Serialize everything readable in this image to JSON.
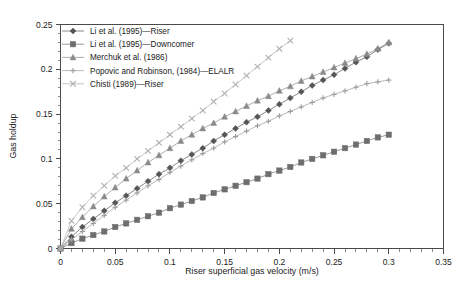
{
  "chart_data": {
    "type": "line",
    "title": "",
    "xlabel": "Riser superficial gas velocity (m/s)",
    "ylabel": "Gas holdup",
    "xlim": [
      0,
      0.35
    ],
    "ylim": [
      0,
      0.25
    ],
    "xticks": [
      "0",
      "0.05",
      "0.1",
      "0.15",
      "0.2",
      "0.25",
      "0.3",
      "0.35"
    ],
    "xtick_values": [
      0,
      0.05,
      0.1,
      0.15,
      0.2,
      0.25,
      0.3,
      0.35
    ],
    "yticks": [
      "0",
      "0.05",
      "0.1",
      "0.15",
      "0.2",
      "0.25"
    ],
    "ytick_values": [
      0,
      0.05,
      0.1,
      0.15,
      0.2,
      0.25
    ],
    "minor_tick_step_x": 0.01,
    "minor_tick_step_y": 0.01,
    "grid": false,
    "legend_position": "top-left",
    "series": [
      {
        "name": "Li et al. (1995)—Riser",
        "marker": "diamond",
        "color": "#555555",
        "x": [
          0,
          0.01,
          0.02,
          0.03,
          0.04,
          0.05,
          0.06,
          0.07,
          0.08,
          0.09,
          0.1,
          0.11,
          0.12,
          0.13,
          0.14,
          0.15,
          0.16,
          0.17,
          0.18,
          0.19,
          0.2,
          0.21,
          0.22,
          0.23,
          0.24,
          0.25,
          0.26,
          0.27,
          0.28,
          0.29,
          0.3
        ],
        "values": [
          0,
          0.013,
          0.024,
          0.033,
          0.042,
          0.051,
          0.059,
          0.067,
          0.075,
          0.083,
          0.09,
          0.098,
          0.105,
          0.112,
          0.12,
          0.127,
          0.134,
          0.141,
          0.147,
          0.154,
          0.161,
          0.168,
          0.175,
          0.182,
          0.188,
          0.194,
          0.201,
          0.208,
          0.214,
          0.222,
          0.229
        ]
      },
      {
        "name": "Li et al. (1995)—Downcomer",
        "marker": "square",
        "color": "#6e6e6e",
        "x": [
          0,
          0.01,
          0.02,
          0.03,
          0.04,
          0.05,
          0.06,
          0.07,
          0.08,
          0.09,
          0.1,
          0.11,
          0.12,
          0.13,
          0.14,
          0.15,
          0.16,
          0.17,
          0.18,
          0.19,
          0.2,
          0.21,
          0.22,
          0.23,
          0.24,
          0.25,
          0.26,
          0.27,
          0.28,
          0.29,
          0.3
        ],
        "values": [
          0,
          0.006,
          0.011,
          0.015,
          0.019,
          0.024,
          0.028,
          0.032,
          0.036,
          0.04,
          0.045,
          0.049,
          0.053,
          0.057,
          0.062,
          0.066,
          0.07,
          0.074,
          0.078,
          0.083,
          0.087,
          0.091,
          0.096,
          0.1,
          0.104,
          0.108,
          0.112,
          0.116,
          0.12,
          0.124,
          0.127
        ]
      },
      {
        "name": "Merchuk et al. (1986)",
        "marker": "triangle",
        "color": "#8a8a8a",
        "x": [
          0,
          0.01,
          0.02,
          0.03,
          0.04,
          0.05,
          0.06,
          0.07,
          0.08,
          0.09,
          0.1,
          0.11,
          0.12,
          0.13,
          0.14,
          0.15,
          0.16,
          0.17,
          0.18,
          0.19,
          0.2,
          0.21,
          0.22,
          0.23,
          0.24,
          0.25,
          0.26,
          0.27,
          0.28,
          0.29,
          0.3
        ],
        "values": [
          0,
          0.022,
          0.035,
          0.047,
          0.058,
          0.068,
          0.078,
          0.087,
          0.096,
          0.104,
          0.112,
          0.12,
          0.127,
          0.134,
          0.14,
          0.147,
          0.153,
          0.159,
          0.165,
          0.17,
          0.176,
          0.181,
          0.187,
          0.192,
          0.197,
          0.202,
          0.207,
          0.212,
          0.217,
          0.223,
          0.23
        ]
      },
      {
        "name": "Popovic and Robinson, (1984)—ELALR",
        "marker": "plus",
        "color": "#9c9c9c",
        "x": [
          0,
          0.01,
          0.02,
          0.03,
          0.04,
          0.05,
          0.06,
          0.07,
          0.08,
          0.09,
          0.1,
          0.11,
          0.12,
          0.13,
          0.14,
          0.15,
          0.16,
          0.17,
          0.18,
          0.19,
          0.2,
          0.21,
          0.22,
          0.23,
          0.24,
          0.25,
          0.26,
          0.27,
          0.28,
          0.29,
          0.3
        ],
        "values": [
          0,
          0.01,
          0.019,
          0.028,
          0.037,
          0.046,
          0.054,
          0.062,
          0.07,
          0.077,
          0.085,
          0.092,
          0.099,
          0.106,
          0.112,
          0.119,
          0.125,
          0.131,
          0.137,
          0.142,
          0.148,
          0.153,
          0.158,
          0.163,
          0.168,
          0.172,
          0.176,
          0.18,
          0.184,
          0.186,
          0.188
        ]
      },
      {
        "name": "Chisti (1989)—Riser",
        "marker": "cross",
        "color": "#b0b0b0",
        "x": [
          0,
          0.01,
          0.02,
          0.03,
          0.04,
          0.05,
          0.06,
          0.07,
          0.08,
          0.09,
          0.1,
          0.11,
          0.12,
          0.13,
          0.14,
          0.15,
          0.16,
          0.17,
          0.18,
          0.19,
          0.2,
          0.21
        ],
        "values": [
          0,
          0.031,
          0.046,
          0.059,
          0.07,
          0.081,
          0.09,
          0.1,
          0.109,
          0.118,
          0.127,
          0.136,
          0.145,
          0.154,
          0.164,
          0.173,
          0.183,
          0.193,
          0.203,
          0.213,
          0.223,
          0.232
        ]
      }
    ]
  },
  "caption": {
    "text": ""
  }
}
